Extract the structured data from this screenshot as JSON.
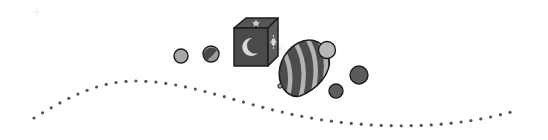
{
  "illustration": {
    "label": "Toys divider: cube, spinning top and marbles with dotted wave",
    "colors": {
      "background": "#ffffff",
      "outline": "#1e1e1e",
      "dark": "#4a4a4a",
      "mid": "#7a7a7a",
      "light": "#b5b5b5",
      "dot": "#555555"
    },
    "objects": [
      {
        "name": "small-ball-icon",
        "cx": 181,
        "cy": 56,
        "r": 7,
        "fill": "#a8a8a8"
      },
      {
        "name": "marble-icon",
        "cx": 211,
        "cy": 54,
        "r": 8,
        "fill": "#9a9a9a"
      },
      {
        "name": "light-ball-icon",
        "cx": 327,
        "cy": 50,
        "r": 8.5,
        "fill": "#b8b8b8"
      },
      {
        "name": "dark-ball-right-icon",
        "cx": 359,
        "cy": 75,
        "r": 9,
        "fill": "#5a5a5a"
      },
      {
        "name": "dark-ball-bottom-icon",
        "cx": 336,
        "cy": 91,
        "r": 7,
        "fill": "#5e5e5e"
      }
    ],
    "dots": {
      "spacing": 10,
      "radius": 1.6,
      "path": "M34,118 C70,96 100,80 140,81 C200,83 250,110 330,121 C400,130 460,126 511,112"
    }
  }
}
